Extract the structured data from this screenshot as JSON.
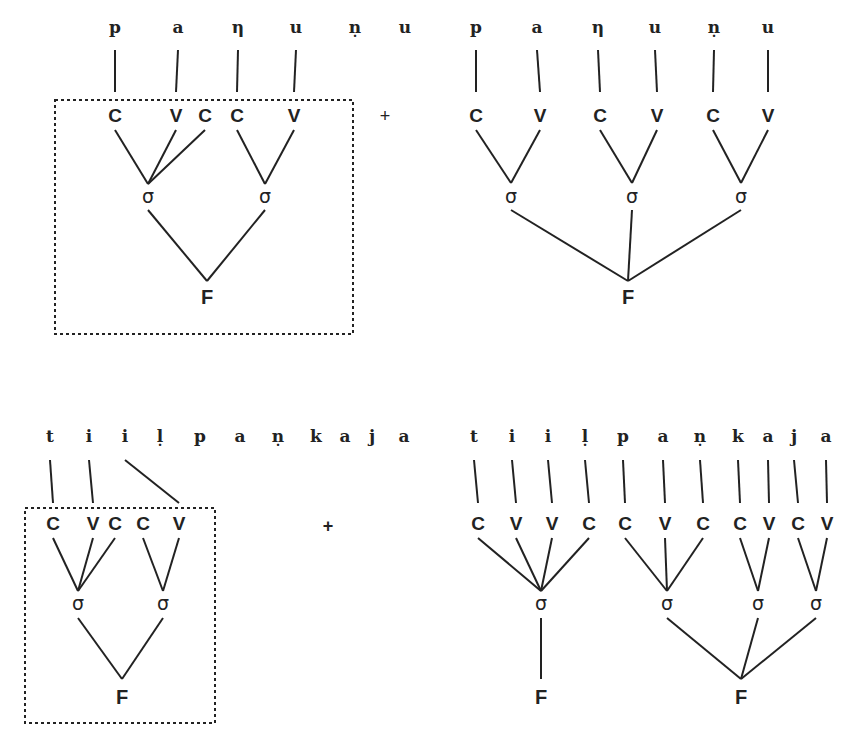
{
  "diagram": {
    "plus_sign": "+",
    "labels": {
      "syllable": "σ",
      "foot": "F"
    },
    "examples": [
      {
        "id": "panunu",
        "segments": [
          "p",
          "a",
          "η",
          "u",
          "ṇ",
          "u"
        ],
        "left_analysis": {
          "boxed": true,
          "skeleton": [
            "C",
            "V",
            "C",
            "C",
            "V"
          ],
          "syllables": [
            {
              "skeleton_indices": [
                0,
                1,
                2
              ]
            },
            {
              "skeleton_indices": [
                3,
                4
              ]
            }
          ],
          "feet": [
            {
              "syllable_indices": [
                0,
                1
              ]
            }
          ]
        },
        "right_analysis": {
          "boxed": false,
          "skeleton": [
            "C",
            "V",
            "C",
            "V",
            "C",
            "V"
          ],
          "syllables": [
            {
              "skeleton_indices": [
                0,
                1
              ]
            },
            {
              "skeleton_indices": [
                2,
                3
              ]
            },
            {
              "skeleton_indices": [
                4,
                5
              ]
            }
          ],
          "feet": [
            {
              "syllable_indices": [
                0,
                1,
                2
              ]
            }
          ]
        }
      },
      {
        "id": "tiilpankaja",
        "segments": [
          "t",
          "i",
          "i",
          "ḷ",
          "p",
          "a",
          "ṇ",
          "k",
          "a",
          "j",
          "a"
        ],
        "left_analysis": {
          "boxed": true,
          "skeleton": [
            "C",
            "V",
            "C",
            "C",
            "V"
          ],
          "syllables": [
            {
              "skeleton_indices": [
                0,
                1,
                2
              ]
            },
            {
              "skeleton_indices": [
                3,
                4
              ]
            }
          ],
          "feet": [
            {
              "syllable_indices": [
                0,
                1
              ]
            }
          ]
        },
        "right_analysis": {
          "boxed": false,
          "skeleton": [
            "C",
            "V",
            "V",
            "C",
            "C",
            "V",
            "C",
            "C",
            "V",
            "C",
            "V"
          ],
          "syllables": [
            {
              "skeleton_indices": [
                0,
                1,
                2,
                3
              ]
            },
            {
              "skeleton_indices": [
                4,
                5,
                6
              ]
            },
            {
              "skeleton_indices": [
                7,
                8
              ]
            },
            {
              "skeleton_indices": [
                9,
                10
              ]
            }
          ],
          "feet": [
            {
              "syllable_indices": [
                0
              ]
            },
            {
              "syllable_indices": [
                1,
                2,
                3
              ]
            }
          ]
        }
      }
    ]
  }
}
